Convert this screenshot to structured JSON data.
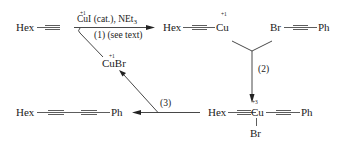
{
  "diagram": {
    "type": "reaction-scheme",
    "colors": {
      "ink": "#222222",
      "background": "#ffffff"
    },
    "species": {
      "start": {
        "left": "Hex",
        "right": ""
      },
      "cu_acetylide": {
        "left": "Hex",
        "metal": "Cu",
        "ox": "+1"
      },
      "bromoalkyne": {
        "left": "Br",
        "right": "Ph"
      },
      "cu3_complex": {
        "left": "Hex",
        "metal": "Cu",
        "ox": "+3",
        "right": "Ph",
        "below": "Br"
      },
      "product": {
        "left": "Hex",
        "right": "Ph"
      },
      "cubr": {
        "label": "CuBr",
        "ox": "+1"
      }
    },
    "step1": {
      "reagent_ox": "+1",
      "reagent_main": "CuI (cat.), NEt",
      "reagent_sub": "3",
      "label": "(1) (see text)"
    },
    "step2": {
      "label": "(2)"
    },
    "step3": {
      "label": "(3)"
    }
  }
}
